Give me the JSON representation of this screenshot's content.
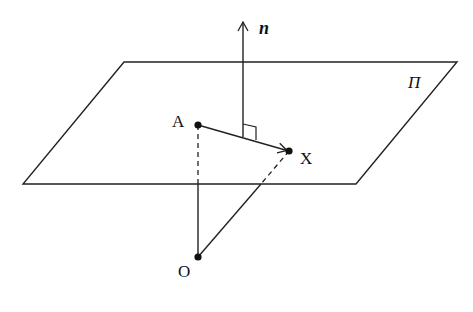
{
  "diagram": {
    "type": "geometry-3d-plane",
    "colors": {
      "stroke": "#222222",
      "background": "#ffffff"
    },
    "plane": {
      "label": "Π",
      "corners": [
        [
          124,
          62
        ],
        [
          457,
          62
        ],
        [
          356,
          184
        ],
        [
          23,
          184
        ]
      ]
    },
    "normal": {
      "label": "n",
      "from": [
        243,
        137
      ],
      "to": [
        243,
        21
      ]
    },
    "points": {
      "A": {
        "label": "A",
        "x": 198,
        "y": 125
      },
      "X": {
        "label": "X",
        "x": 289,
        "y": 151
      },
      "O": {
        "label": "O",
        "x": 198,
        "y": 257
      }
    },
    "segments": [
      {
        "name": "A-to-X",
        "style": "arrow"
      },
      {
        "name": "O-to-A",
        "style": "solid-below-dashed-above"
      },
      {
        "name": "O-to-X",
        "style": "solid-below-dashed-above"
      }
    ],
    "right_angle_marker": true
  }
}
